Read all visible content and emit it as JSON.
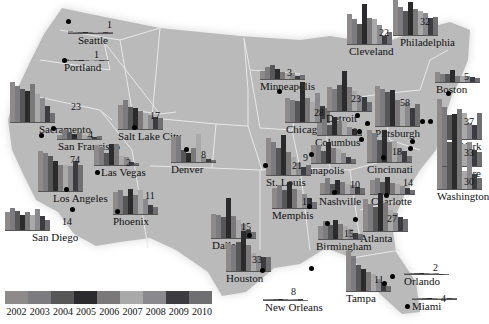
{
  "chart_data": {
    "type": "bar",
    "title": "",
    "subtitle": "Small-multiple bar charts placed on a map of the United States, one per city, with bars for years 2002-2010; the number beside each chart is its labeled value.",
    "xlabel": "",
    "ylabel": "",
    "grid": false,
    "legend_position": "bottom-left",
    "categories": [
      "2002",
      "2003",
      "2004",
      "2005",
      "2006",
      "2007",
      "2008",
      "2009",
      "2010"
    ],
    "legend_colors": [
      "#8f8a8a",
      "#7b7b80",
      "#575757",
      "#2b2b2e",
      "#7a7878",
      "#a9a9a9",
      "#8a8a8e",
      "#3c3c40",
      "#6f6f72"
    ],
    "cities": [
      {
        "name": "Seattle",
        "label": "1",
        "chart": [
          12,
          10,
          8,
          6,
          5,
          4,
          6,
          5,
          4
        ],
        "cx": 68,
        "cy": 17,
        "lx": 68,
        "ly": 21,
        "nx": 78,
        "ny": 35,
        "vx": 107,
        "vy": 20
      },
      {
        "name": "Portland",
        "label": "1",
        "chart": [
          4,
          3,
          3,
          2,
          2,
          2,
          3,
          2,
          3
        ],
        "cx": 64,
        "cy": 57,
        "lx": 64,
        "ly": 60,
        "nx": 64,
        "ny": 62,
        "vx": 94,
        "vy": 50
      },
      {
        "name": "Sacramento",
        "label": "23",
        "chart": [
          100,
          90,
          82,
          78,
          96,
          70,
          60,
          40,
          22
        ],
        "cx": 10,
        "cy": 91,
        "lx": 53,
        "ly": 128,
        "nx": 39,
        "ny": 124,
        "vx": 71,
        "vy": 102
      },
      {
        "name": "San Francisco",
        "label": "4",
        "chart": [
          10,
          22,
          18,
          12,
          14,
          10,
          8,
          6,
          8
        ],
        "cx": 57,
        "cy": 130,
        "lx": 41,
        "ly": 135,
        "nx": 58,
        "ny": 141,
        "vx": 88,
        "vy": 130
      },
      {
        "name": "Los Angeles",
        "label": "74",
        "chart": [
          100,
          96,
          88,
          75,
          64,
          64,
          62,
          74,
          64
        ],
        "cx": 38,
        "cy": 147,
        "lx": 66,
        "ly": 189,
        "nx": 53,
        "ny": 193,
        "vx": 70,
        "vy": 155
      },
      {
        "name": "San Diego",
        "label": "14",
        "chart": [
          45,
          55,
          48,
          38,
          45,
          38,
          52,
          35,
          24
        ],
        "cx": 5,
        "cy": 220,
        "lx": 72,
        "ly": 209,
        "nx": 32,
        "ny": 232,
        "vx": 62,
        "vy": 217
      },
      {
        "name": "Las Vegas",
        "label": "2",
        "chart": [
          50,
          45,
          30,
          52,
          52,
          22,
          20,
          8,
          6
        ],
        "cx": 94,
        "cy": 159,
        "lx": 97,
        "ly": 172,
        "nx": 101,
        "ny": 167,
        "vx": 126,
        "vy": 158
      },
      {
        "name": "Phoenix",
        "label": "11",
        "chart": [
          56,
          60,
          45,
          62,
          48,
          60,
          38,
          22,
          18
        ],
        "cx": 113,
        "cy": 193,
        "lx": 117,
        "ly": 211,
        "nx": 113,
        "ny": 216,
        "vx": 145,
        "vy": 191
      },
      {
        "name": "Salt Lake City",
        "label": "17",
        "chart": [
          60,
          72,
          55,
          52,
          46,
          40,
          36,
          30,
          28
        ],
        "cx": 118,
        "cy": 113,
        "lx": 134,
        "ly": 127,
        "nx": 118,
        "ny": 131,
        "vx": 150,
        "vy": 111
      },
      {
        "name": "Denver",
        "label": "8",
        "chart": [
          62,
          66,
          30,
          22,
          34,
          70,
          12,
          8,
          6
        ],
        "cx": 171,
        "cy": 150,
        "lx": 186,
        "ly": 149,
        "nx": 171,
        "ny": 164,
        "vx": 201,
        "vy": 150
      },
      {
        "name": "Minneapolis",
        "label": "3",
        "chart": [
          20,
          30,
          35,
          24,
          18,
          14,
          16,
          8,
          10
        ],
        "cx": 260,
        "cy": 75,
        "lx": 279,
        "ly": 91,
        "nx": 260,
        "ny": 81,
        "vx": 287,
        "vy": 68
      },
      {
        "name": "Chicago",
        "label": "28",
        "chart": [
          60,
          56,
          52,
          100,
          60,
          50,
          72,
          40,
          34
        ],
        "cx": 285,
        "cy": 106,
        "lx": 322,
        "ly": 128,
        "nx": 286,
        "ny": 124,
        "vx": 314,
        "vy": 108
      },
      {
        "name": "Detroit",
        "label": "23",
        "chart": [
          60,
          56,
          64,
          100,
          60,
          50,
          38,
          36,
          22
        ],
        "cx": 327,
        "cy": 96,
        "lx": 357,
        "ly": 115,
        "nx": 326,
        "ny": 113,
        "vx": 351,
        "vy": 94
      },
      {
        "name": "Columbus",
        "label": "6",
        "chart": [
          30,
          40,
          24,
          44,
          36,
          34,
          20,
          14,
          12
        ],
        "cx": 317,
        "cy": 130,
        "lx": 361,
        "ly": 139,
        "nx": 315,
        "ny": 137,
        "vx": 352,
        "vy": 127
      },
      {
        "name": "Cleveland",
        "label": "22",
        "chart": [
          76,
          62,
          50,
          100,
          66,
          62,
          48,
          20,
          30
        ],
        "cx": 347,
        "cy": 20,
        "lx": 359,
        "ly": 131,
        "nx": 349,
        "ny": 46,
        "vx": 379,
        "vy": 28
      },
      {
        "name": "Philadelphia",
        "label": "32",
        "chart": [
          100,
          70,
          60,
          82,
          66,
          60,
          56,
          42,
          46
        ],
        "cx": 393,
        "cy": 17,
        "lx": 422,
        "ly": 121,
        "nx": 400,
        "ny": 37,
        "vx": 420,
        "vy": 17
      },
      {
        "name": "Boston",
        "label": "5",
        "chart": [
          26,
          20,
          20,
          30,
          16,
          14,
          16,
          12,
          10
        ],
        "cx": 435,
        "cy": 69,
        "lx": 448,
        "ly": 93,
        "nx": 436,
        "ny": 84,
        "vx": 464,
        "vy": 72
      },
      {
        "name": "Pittsburgh",
        "label": "58",
        "chart": [
          100,
          92,
          84,
          90,
          66,
          60,
          58,
          44,
          56
        ],
        "cx": 375,
        "cy": 80,
        "lx": 367,
        "ly": 123,
        "nx": 375,
        "ny": 128,
        "vx": 400,
        "vy": 98
      },
      {
        "name": "New York",
        "label": "37",
        "chart": [
          100,
          80,
          60,
          62,
          76,
          64,
          40,
          36,
          64
        ],
        "cx": 437,
        "cy": 110,
        "lx": 430,
        "ly": 121,
        "nx": 437,
        "ny": 141,
        "vx": 464,
        "vy": 117
      },
      {
        "name": "Baltimore",
        "label": "33",
        "chart": [
          90,
          68,
          60,
          70,
          70,
          56,
          60,
          40,
          36
        ],
        "cx": 437,
        "cy": 148,
        "lx": 412,
        "ly": 141,
        "nx": 437,
        "ny": 168,
        "vx": 464,
        "vy": 148
      },
      {
        "name": "Washington",
        "label": "30",
        "chart": [
          70,
          55,
          60,
          88,
          60,
          44,
          64,
          38,
          28
        ],
        "cx": 437,
        "cy": 177,
        "lx": 410,
        "ly": 148,
        "nx": 437,
        "ny": 191,
        "vx": 464,
        "vy": 177
      },
      {
        "name": "Cincinnati",
        "label": "18",
        "chart": [
          80,
          72,
          56,
          80,
          50,
          52,
          36,
          28,
          16
        ],
        "cx": 367,
        "cy": 150,
        "lx": 383,
        "ly": 157,
        "nx": 367,
        "ny": 164,
        "vx": 392,
        "vy": 147
      },
      {
        "name": "Indianapolis",
        "label": "9",
        "chart": [
          44,
          44,
          30,
          52,
          38,
          36,
          26,
          14,
          10
        ],
        "cx": 311,
        "cy": 153,
        "lx": 311,
        "ly": 154,
        "nx": 290,
        "ny": 165,
        "vx": 303,
        "vy": 153
      },
      {
        "name": "St. Louis",
        "label": "21",
        "chart": [
          92,
          82,
          68,
          100,
          58,
          44,
          30,
          20,
          24
        ],
        "cx": 266,
        "cy": 154,
        "lx": 265,
        "ly": 165,
        "nx": 266,
        "ny": 177,
        "vx": 292,
        "vy": 161
      },
      {
        "name": "Nashville",
        "label": "10",
        "chart": [
          28,
          40,
          24,
          36,
          30,
          26,
          22,
          18,
          16
        ],
        "cx": 320,
        "cy": 178,
        "lx": 334,
        "ly": 192,
        "nx": 319,
        "ny": 196,
        "vx": 350,
        "vy": 180
      },
      {
        "name": "Charlotte",
        "label": "14",
        "chart": [
          36,
          40,
          30,
          42,
          28,
          24,
          20,
          14,
          10
        ],
        "cx": 370,
        "cy": 176,
        "lx": 386,
        "ly": 195,
        "nx": 371,
        "ny": 196,
        "vx": 403,
        "vy": 178
      },
      {
        "name": "Memphis",
        "label": "13",
        "chart": [
          50,
          58,
          46,
          64,
          48,
          44,
          34,
          24,
          16
        ],
        "cx": 272,
        "cy": 198,
        "lx": 309,
        "ly": 206,
        "nx": 272,
        "ny": 210,
        "vx": 302,
        "vy": 197
      },
      {
        "name": "Atlanta",
        "label": "27",
        "chart": [
          80,
          68,
          60,
          96,
          70,
          52,
          44,
          36,
          30
        ],
        "cx": 363,
        "cy": 212,
        "lx": 355,
        "ly": 219,
        "nx": 360,
        "ny": 233,
        "vx": 387,
        "vy": 214
      },
      {
        "name": "Birmingham",
        "label": "15",
        "chart": [
          32,
          44,
          36,
          48,
          38,
          32,
          24,
          16,
          12
        ],
        "cx": 318,
        "cy": 227,
        "lx": 327,
        "ly": 223,
        "nx": 316,
        "ny": 241,
        "vx": 344,
        "vy": 229
      },
      {
        "name": "Dallas",
        "label": "15",
        "chart": [
          60,
          58,
          52,
          100,
          56,
          44,
          34,
          20,
          14
        ],
        "cx": 211,
        "cy": 215,
        "lx": 249,
        "ly": 235,
        "nx": 212,
        "ny": 240,
        "vx": 241,
        "vy": 222
      },
      {
        "name": "Houston",
        "label": "33",
        "chart": [
          70,
          64,
          72,
          100,
          64,
          44,
          38,
          36,
          34
        ],
        "cx": 226,
        "cy": 252,
        "lx": 262,
        "ly": 270,
        "nx": 226,
        "ny": 273,
        "vx": 252,
        "vy": 255
      },
      {
        "name": "New Orleans",
        "label": "8",
        "chart": [
          4,
          6,
          8,
          4,
          6,
          4,
          5,
          4,
          3
        ],
        "cx": 263,
        "cy": 292,
        "lx": 311,
        "ly": 268,
        "nx": 265,
        "ny": 302,
        "vx": 291,
        "vy": 287
      },
      {
        "name": "Tampa",
        "label": "11",
        "chart": [
          100,
          88,
          64,
          56,
          48,
          42,
          30,
          20,
          12
        ],
        "cx": 346,
        "cy": 261,
        "lx": 384,
        "ly": 283,
        "nx": 346,
        "ny": 293,
        "vx": 374,
        "vy": 275
      },
      {
        "name": "Orlando",
        "label": "2",
        "chart": [
          4,
          5,
          6,
          4,
          8,
          6,
          4,
          3,
          3
        ],
        "cx": 404,
        "cy": 268,
        "lx": 392,
        "ly": 276,
        "nx": 404,
        "ny": 276,
        "vx": 433,
        "vy": 263
      },
      {
        "name": "Miami",
        "label": "4",
        "chart": [
          6,
          8,
          10,
          6,
          8,
          10,
          6,
          4,
          4
        ],
        "cx": 412,
        "cy": 296,
        "lx": 407,
        "ly": 306,
        "nx": 412,
        "ny": 301,
        "vx": 441,
        "vy": 294
      }
    ]
  },
  "map": {
    "fill": "#b9b9b9",
    "border": "#e6e6e6"
  },
  "legend": {
    "years": [
      "2002",
      "2003",
      "2004",
      "2005",
      "2006",
      "2007",
      "2008",
      "2009",
      "2010"
    ]
  }
}
